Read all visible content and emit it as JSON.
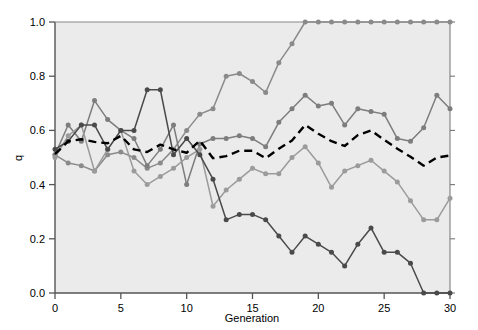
{
  "chart_data": {
    "type": "line",
    "title": "",
    "subtitle": "",
    "xlabel": "Generation",
    "ylabel": "q",
    "xlim": [
      0,
      30
    ],
    "ylim": [
      0.0,
      1.0
    ],
    "xticks": [
      0,
      5,
      10,
      15,
      20,
      25,
      30
    ],
    "xtick_labels": [
      "0",
      "5",
      "10",
      "15",
      "20",
      "25",
      "30"
    ],
    "yticks": [
      0.0,
      0.2,
      0.4,
      0.6,
      0.8,
      1.0
    ],
    "ytick_labels": [
      "0.0",
      "0.2",
      "0.4",
      "0.6",
      "0.8",
      "1.0"
    ],
    "grid": false,
    "legend": "none",
    "plot_background": "#ebebeb",
    "markers": true,
    "marker_shape": "circle",
    "x": [
      0,
      1,
      2,
      3,
      4,
      5,
      6,
      7,
      8,
      9,
      10,
      11,
      12,
      13,
      14,
      15,
      16,
      17,
      18,
      19,
      20,
      21,
      22,
      23,
      24,
      25,
      26,
      27,
      28,
      29,
      30
    ],
    "series": [
      {
        "name": "Population 1",
        "color": "#8a8a8a",
        "linestyle": "solid",
        "values": [
          0.51,
          0.48,
          0.47,
          0.45,
          0.51,
          0.52,
          0.5,
          0.46,
          0.48,
          0.53,
          0.6,
          0.66,
          0.68,
          0.8,
          0.81,
          0.78,
          0.74,
          0.85,
          0.92,
          1.0,
          1.0,
          1.0,
          1.0,
          1.0,
          1.0,
          1.0,
          1.0,
          1.0,
          1.0,
          1.0,
          1.0
        ]
      },
      {
        "name": "Population 2",
        "color": "#7d7d7d",
        "linestyle": "solid",
        "values": [
          0.51,
          0.62,
          0.56,
          0.71,
          0.64,
          0.6,
          0.57,
          0.47,
          0.53,
          0.62,
          0.4,
          0.55,
          0.57,
          0.57,
          0.58,
          0.57,
          0.54,
          0.63,
          0.68,
          0.73,
          0.69,
          0.7,
          0.62,
          0.68,
          0.67,
          0.66,
          0.57,
          0.56,
          0.61,
          0.73,
          0.68
        ]
      },
      {
        "name": "Population 3",
        "color": "#9b9b9b",
        "linestyle": "solid",
        "values": [
          0.5,
          0.58,
          0.62,
          0.45,
          0.53,
          0.6,
          0.45,
          0.4,
          0.43,
          0.46,
          0.5,
          0.53,
          0.32,
          0.38,
          0.42,
          0.46,
          0.44,
          0.44,
          0.5,
          0.54,
          0.48,
          0.39,
          0.45,
          0.47,
          0.49,
          0.45,
          0.41,
          0.34,
          0.27,
          0.27,
          0.35
        ]
      },
      {
        "name": "Population 4",
        "color": "#4a4a4a",
        "linestyle": "solid",
        "values": [
          0.53,
          0.56,
          0.62,
          0.62,
          0.53,
          0.6,
          0.6,
          0.75,
          0.75,
          0.51,
          0.57,
          0.51,
          0.42,
          0.27,
          0.29,
          0.29,
          0.27,
          0.21,
          0.15,
          0.21,
          0.18,
          0.15,
          0.1,
          0.18,
          0.24,
          0.15,
          0.15,
          0.11,
          0.0,
          0.0,
          0.0
        ]
      }
    ],
    "mean_line": {
      "name": "Mean",
      "color": "#000000",
      "linestyle": "dashed",
      "values": [
        0.5125,
        0.56,
        0.5675,
        0.5575,
        0.5525,
        0.58,
        0.53,
        0.52,
        0.5475,
        0.53,
        0.5175,
        0.5625,
        0.4975,
        0.505,
        0.525,
        0.525,
        0.4975,
        0.5325,
        0.5625,
        0.62,
        0.5875,
        0.56,
        0.5425,
        0.5825,
        0.6,
        0.565,
        0.5325,
        0.5025,
        0.47,
        0.5,
        0.5075
      ]
    }
  },
  "axis": {
    "y_label": "q",
    "x_label": "Generation"
  }
}
